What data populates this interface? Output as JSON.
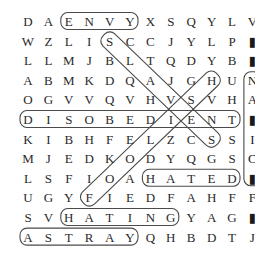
{
  "puzzle": {
    "type": "word-search",
    "grid": [
      [
        "D",
        "A",
        "E",
        "N",
        "V",
        "Y",
        "X",
        "S",
        "Q",
        "Y",
        "L",
        "V"
      ],
      [
        "W",
        "Z",
        "L",
        "I",
        "S",
        "C",
        "C",
        "J",
        "Y",
        "L",
        "P",
        "■"
      ],
      [
        "L",
        "L",
        "M",
        "J",
        "B",
        "L",
        "T",
        "Q",
        "D",
        "Y",
        "B",
        "■"
      ],
      [
        "A",
        "B",
        "M",
        "K",
        "D",
        "Q",
        "A",
        "J",
        "G",
        "H",
        "U",
        "N"
      ],
      [
        "O",
        "G",
        "V",
        "V",
        "Q",
        "V",
        "H",
        "V",
        "S",
        "V",
        "H",
        "A"
      ],
      [
        "D",
        "I",
        "S",
        "O",
        "B",
        "E",
        "D",
        "I",
        "E",
        "N",
        "T",
        "■"
      ],
      [
        "K",
        "I",
        "B",
        "H",
        "F",
        "E",
        "L",
        "Z",
        "C",
        "S",
        "S",
        "I"
      ],
      [
        "M",
        "J",
        "E",
        "D",
        "K",
        "O",
        "D",
        "Y",
        "Q",
        "G",
        "S",
        "C"
      ],
      [
        "L",
        "S",
        "F",
        "I",
        "O",
        "A",
        "H",
        "A",
        "T",
        "E",
        "D",
        "■"
      ],
      [
        "U",
        "G",
        "Y",
        "F",
        "I",
        "E",
        "D",
        "F",
        "A",
        "H",
        "F",
        "F"
      ],
      [
        "S",
        "V",
        "H",
        "A",
        "T",
        "I",
        "N",
        "G",
        "Y",
        "A",
        "G",
        "■"
      ],
      [
        "A",
        "S",
        "T",
        "R",
        "A",
        "Y",
        "Q",
        "H",
        "B",
        "D",
        "T",
        "J"
      ]
    ],
    "partial_last_column": true,
    "found_words": [
      {
        "word": "ENVY",
        "start": [
          0,
          2
        ],
        "end": [
          0,
          5
        ],
        "direction": "horizontal"
      },
      {
        "word": "DISOBEDIENT",
        "start": [
          5,
          0
        ],
        "end": [
          5,
          10
        ],
        "direction": "horizontal"
      },
      {
        "word": "HATED",
        "start": [
          8,
          6
        ],
        "end": [
          8,
          10
        ],
        "direction": "horizontal"
      },
      {
        "word": "HATING",
        "start": [
          10,
          2
        ],
        "end": [
          10,
          7
        ],
        "direction": "horizontal"
      },
      {
        "word": "ASTRAY",
        "start": [
          11,
          0
        ],
        "end": [
          11,
          5
        ],
        "direction": "horizontal"
      },
      {
        "word": "SLAVES",
        "start": [
          1,
          4
        ],
        "end": [
          6,
          9
        ],
        "direction": "diagonal-down-right"
      },
      {
        "word": "FOOLISH",
        "start": [
          9,
          3
        ],
        "end": [
          3,
          9
        ],
        "direction": "diagonal-up-right"
      },
      {
        "word": "",
        "start": [
          3,
          11
        ],
        "end": [
          8,
          11
        ],
        "direction": "vertical",
        "clipped": true
      }
    ],
    "colors": {
      "letter": "#2a2a2a",
      "outline": "#4a4a4a",
      "background": "#ffffff"
    }
  }
}
